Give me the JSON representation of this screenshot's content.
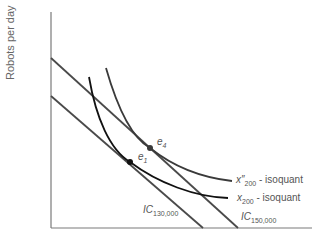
{
  "diagram": {
    "y_axis_label": "Robots per day",
    "x_axis_label": "",
    "colors": {
      "axis": "#7a7a7a",
      "budget_lines": "#4a4a4a",
      "isoquant_x200": "#111111",
      "isoquant_x200_double_prime": "#3a3a3a",
      "points": "#222222",
      "text": "#555555"
    },
    "lines": [
      {
        "id": "ic130",
        "label_main": "IC",
        "label_sub": "130,000"
      },
      {
        "id": "ic150",
        "label_main": "IC",
        "label_sub": "150,000"
      }
    ],
    "isoquants": [
      {
        "id": "x200pp",
        "label_main": "x″",
        "label_sub": "200",
        "label_suffix": " - isoquant"
      },
      {
        "id": "x200",
        "label_main": "x",
        "label_sub": "200",
        "label_suffix": " - isoquant"
      }
    ],
    "points": [
      {
        "id": "e4",
        "label_main": "e",
        "label_sub": "4"
      },
      {
        "id": "e1",
        "label_main": "e",
        "label_sub": "1"
      }
    ]
  }
}
